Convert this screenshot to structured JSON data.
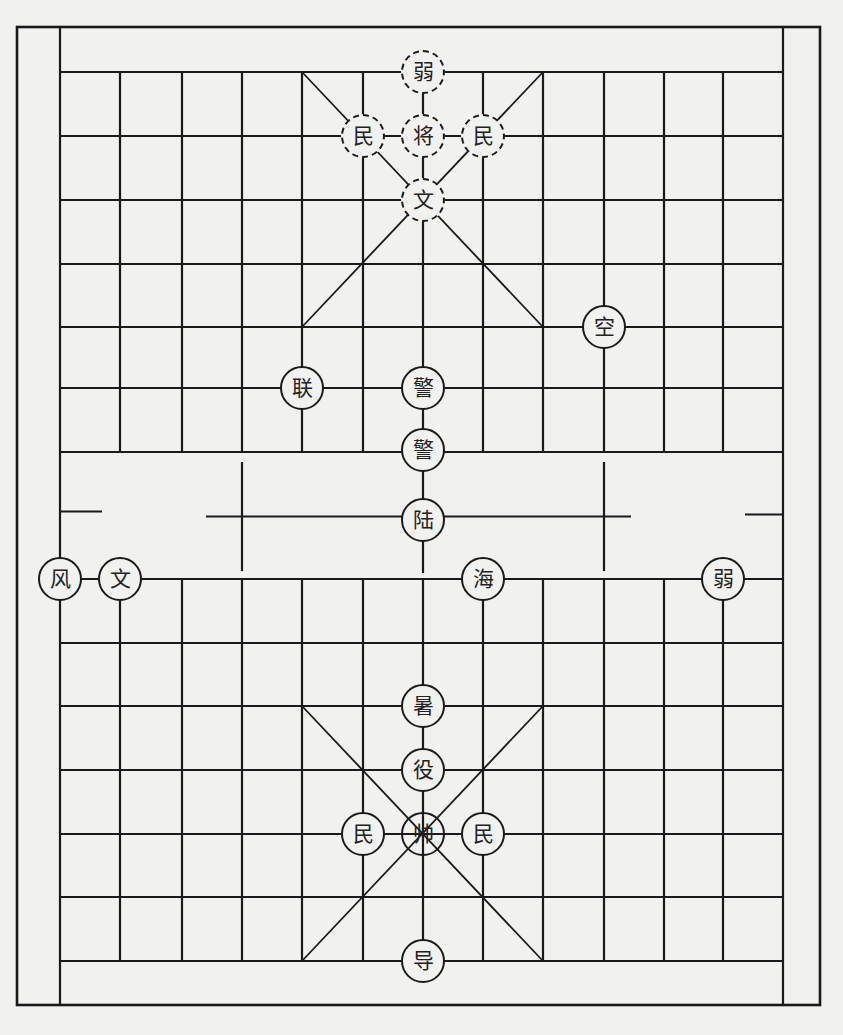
{
  "board": {
    "background": "#f1f1f0",
    "line_color": "#1a1a1a",
    "outer_frame": {
      "x1": 17,
      "y1": 27,
      "x2": 820,
      "y2": 1005
    },
    "columns_x": [
      60,
      120,
      182,
      242,
      302,
      363,
      423,
      483,
      543,
      604,
      664,
      723,
      783
    ],
    "top_rows_y": [
      72,
      136,
      200,
      264,
      327,
      388,
      452
    ],
    "bottom_rows_y": [
      579,
      643,
      706,
      770,
      834,
      897,
      961
    ],
    "river": {
      "top_y": 452,
      "bottom_y": 579
    },
    "top_palace": {
      "x1": 302,
      "y1": 72,
      "x2": 543,
      "y2": 327
    },
    "bottom_palace": {
      "x1": 302,
      "y1": 706,
      "x2": 543,
      "y2": 961
    }
  },
  "pieces": [
    {
      "label": "弱",
      "x": 423,
      "y": 72,
      "side": "top",
      "style": "dashed"
    },
    {
      "label": "民",
      "x": 363,
      "y": 136,
      "side": "top",
      "style": "dashed"
    },
    {
      "label": "将",
      "x": 423,
      "y": 136,
      "side": "top",
      "style": "dashed"
    },
    {
      "label": "民",
      "x": 483,
      "y": 136,
      "side": "top",
      "style": "dashed"
    },
    {
      "label": "文",
      "x": 423,
      "y": 200,
      "side": "top",
      "style": "dashed"
    },
    {
      "label": "空",
      "x": 604,
      "y": 327,
      "side": "bottom",
      "style": "solid"
    },
    {
      "label": "联",
      "x": 302,
      "y": 388,
      "side": "bottom",
      "style": "solid"
    },
    {
      "label": "警",
      "x": 423,
      "y": 388,
      "side": "bottom",
      "style": "solid"
    },
    {
      "label": "警",
      "x": 423,
      "y": 450,
      "side": "bottom",
      "style": "solid"
    },
    {
      "label": "陆",
      "x": 423,
      "y": 520,
      "side": "bottom",
      "style": "solid"
    },
    {
      "label": "风",
      "x": 60,
      "y": 579,
      "side": "bottom",
      "style": "solid"
    },
    {
      "label": "文",
      "x": 120,
      "y": 579,
      "side": "bottom",
      "style": "solid"
    },
    {
      "label": "海",
      "x": 483,
      "y": 579,
      "side": "bottom",
      "style": "solid"
    },
    {
      "label": "弱",
      "x": 723,
      "y": 579,
      "side": "bottom",
      "style": "solid"
    },
    {
      "label": "暑",
      "x": 423,
      "y": 706,
      "side": "bottom",
      "style": "solid"
    },
    {
      "label": "役",
      "x": 423,
      "y": 770,
      "side": "bottom",
      "style": "solid"
    },
    {
      "label": "民",
      "x": 363,
      "y": 834,
      "side": "bottom",
      "style": "solid"
    },
    {
      "label": "帅",
      "x": 423,
      "y": 834,
      "side": "bottom",
      "style": "transparent"
    },
    {
      "label": "民",
      "x": 483,
      "y": 834,
      "side": "bottom",
      "style": "solid"
    },
    {
      "label": "导",
      "x": 423,
      "y": 961,
      "side": "bottom",
      "style": "solid"
    }
  ]
}
